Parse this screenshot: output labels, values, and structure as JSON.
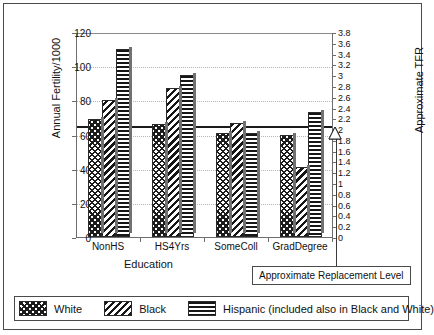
{
  "chart_data": {
    "type": "bar",
    "title": "",
    "categories": [
      "NonHS",
      "HS4Yrs",
      "SomeColl",
      "GradDegree"
    ],
    "series": [
      {
        "name": "White",
        "values": [
          69,
          66,
          61,
          60
        ]
      },
      {
        "name": "Black",
        "values": [
          80,
          87,
          67,
          41
        ]
      },
      {
        "name": "Hispanic",
        "values": [
          110,
          95,
          61,
          73
        ]
      }
    ],
    "xlabel": "Education",
    "ylabel": "Annual Fertility/1000",
    "y2label": "Approximate TFR",
    "ylim": [
      0,
      120
    ],
    "yticks": [
      0,
      20,
      40,
      60,
      80,
      100,
      120
    ],
    "y2lim": [
      0,
      3.8
    ],
    "y2ticks": [
      "0",
      "0.2",
      "0.4",
      "0.6",
      "0.8",
      "1",
      "1.2",
      "1.4",
      "1.6",
      "1.8",
      "2",
      "2.2",
      "2.4",
      "2.6",
      "2.8",
      "3",
      "3.2",
      "3.4",
      "3.6",
      "3.8"
    ],
    "grid": true,
    "legend_position": "bottom",
    "annotations": [
      {
        "name": "replacement-level",
        "label": "Approximate Replacement Level",
        "value": 65.5,
        "tfr": 2.07
      }
    ]
  },
  "axes": {
    "y_title": "Annual Fertility/1000",
    "y2_title": "Approximate TFR",
    "x_title": "Education"
  },
  "legend": {
    "items": [
      {
        "label": "White",
        "pattern": "cross-hatch-swatch"
      },
      {
        "label": "Black",
        "pattern": "diagonal-stripe-swatch"
      },
      {
        "label": "Hispanic (included also in Black and White)",
        "pattern": "horizontal-stripe-swatch"
      }
    ]
  },
  "callout": {
    "label": "Approximate Replacement Level"
  }
}
